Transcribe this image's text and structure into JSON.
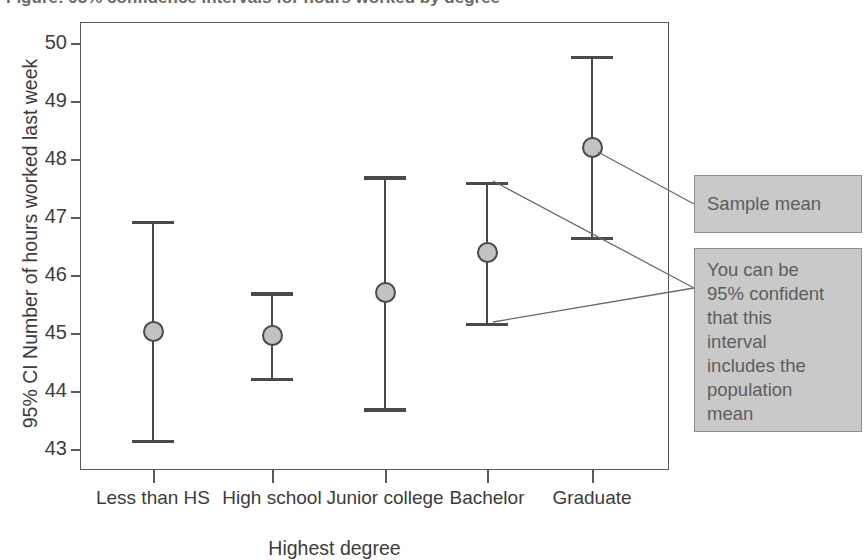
{
  "figure": {
    "cut_title": "Figure: 95% confidence intervals for hours worked by degree"
  },
  "chart_data": {
    "type": "scatter",
    "title": "",
    "xlabel": "Highest degree",
    "ylabel": "95% CI Number of hours worked last week",
    "categories": [
      "Less than\nHS",
      "High school",
      "Junior\ncollege",
      "Bachelor",
      "Graduate"
    ],
    "ylim": [
      42.55,
      50.5
    ],
    "yticks": [
      43,
      44,
      45,
      46,
      47,
      48,
      49,
      50
    ],
    "ytick_labels": [
      "43",
      "44",
      "45",
      "46",
      "47",
      "48",
      "49",
      "50"
    ],
    "grid": false,
    "legend": "none",
    "series": [
      {
        "name": "Sample mean with 95% CI",
        "values": [
          45.03,
          44.96,
          45.7,
          46.4,
          48.2
        ],
        "ci_lower": [
          43.15,
          44.22,
          43.7,
          45.18,
          46.66
        ],
        "ci_upper": [
          46.93,
          45.7,
          47.7,
          47.6,
          49.78
        ]
      }
    ],
    "annotations": [
      {
        "id": "sample-mean",
        "text": "Sample mean",
        "points_to": "mean marker of Graduate"
      },
      {
        "id": "confidence-interval",
        "text": "You can be\n95% confident\nthat this\ninterval\nincludes the\npopulation\nmean",
        "points_to": "upper and lower caps of Bachelor interval"
      }
    ]
  },
  "colors": {
    "marker_fill": "#c2c2c2",
    "line": "#4a4a4a",
    "frame": "#5a5a5a",
    "callout_bg": "#c9c9c9",
    "callout_border": "#8e8e8e",
    "text": "#3c3c3c"
  }
}
